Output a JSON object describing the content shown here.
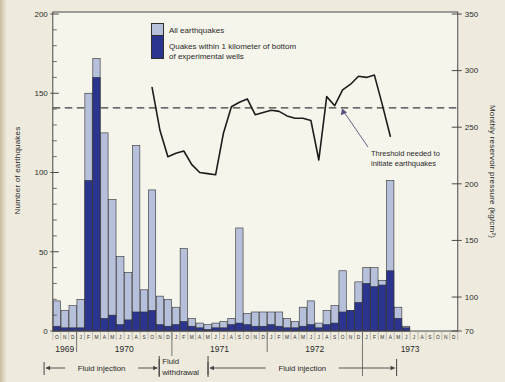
{
  "figure": {
    "legend": {
      "item1": "All earthquakes",
      "item2_line1": "Quakes within 1 kilometer of bottom",
      "item2_line2": "of experimental wells"
    },
    "left_axis_title": "Number of earthquakes",
    "right_axis_title": "Monthly reservoir pressure (kg/cm²)",
    "threshold_label_line1": "Threshold needed to",
    "threshold_label_line2": "initiate earthquakes",
    "colors": {
      "all_quakes": "#b6c0da",
      "near_well_quakes": "#2b3590",
      "pressure_line": "#1c1c1c",
      "axis": "#4a4a4a",
      "threshold_dash": "#3c3c3c",
      "pointer": "#5c4f7d"
    }
  },
  "chart_data": {
    "type": "bar",
    "title": "",
    "xlabel": "",
    "ylabel_left": "Number of earthquakes",
    "ylabel_right": "Monthly reservoir pressure (kg/cm²)",
    "left_axis": {
      "range": [
        0,
        200
      ],
      "ticks": [
        200,
        150,
        100,
        50,
        0
      ],
      "minor_step": 10
    },
    "right_axis": {
      "range": [
        70,
        350
      ],
      "ticks": [
        350,
        300,
        250,
        200,
        150,
        100,
        70
      ]
    },
    "months": [
      "O",
      "N",
      "D",
      "J",
      "F",
      "M",
      "A",
      "M",
      "J",
      "J",
      "A",
      "S",
      "O",
      "N",
      "D",
      "J",
      "F",
      "M",
      "A",
      "M",
      "J",
      "J",
      "A",
      "S",
      "O",
      "N",
      "D",
      "J",
      "F",
      "M",
      "A",
      "M",
      "J",
      "J",
      "A",
      "S",
      "O",
      "N",
      "D",
      "J",
      "F",
      "M",
      "A",
      "M",
      "J",
      "J",
      "A",
      "S",
      "O",
      "N",
      "D"
    ],
    "years": [
      {
        "label": "1969",
        "from_month": 0,
        "to_month": 3
      },
      {
        "label": "1970",
        "from_month": 3,
        "to_month": 15
      },
      {
        "label": "1971",
        "from_month": 15,
        "to_month": 27
      },
      {
        "label": "1972",
        "from_month": 27,
        "to_month": 39
      },
      {
        "label": "1973",
        "from_month": 39,
        "to_month": 51
      }
    ],
    "series": [
      {
        "name": "All earthquakes",
        "values": [
          19,
          13,
          16,
          20,
          150,
          172,
          125,
          83,
          47,
          37,
          117,
          26,
          89,
          22,
          20,
          15,
          52,
          8,
          5,
          4,
          5,
          6,
          8,
          65,
          11,
          12,
          12,
          12,
          12,
          8,
          6,
          15,
          19,
          5,
          13,
          16,
          38,
          13,
          31,
          40,
          40,
          32,
          95,
          15,
          3,
          0,
          0,
          0,
          0,
          0,
          0
        ]
      },
      {
        "name": "Quakes within 1 kilometer of bottom of experimental wells",
        "values": [
          3,
          2,
          2,
          2,
          95,
          160,
          8,
          10,
          4,
          7,
          12,
          12,
          13,
          4,
          3,
          4,
          6,
          3,
          2,
          1,
          2,
          2,
          4,
          5,
          4,
          3,
          3,
          4,
          3,
          2,
          2,
          3,
          4,
          2,
          4,
          5,
          12,
          13,
          18,
          30,
          28,
          29,
          38,
          8,
          2,
          0,
          0,
          0,
          0,
          0,
          0
        ]
      }
    ],
    "pressure_line": {
      "name": "Monthly reservoir pressure (kg/cm²)",
      "start_month_index": 12,
      "values": [
        285,
        247,
        224,
        227,
        229,
        217,
        210,
        209,
        208,
        245,
        268,
        272,
        275,
        261,
        263,
        265,
        264,
        260,
        258,
        258,
        256,
        221,
        277,
        269,
        283,
        288,
        295,
        294,
        296,
        270,
        242
      ]
    },
    "threshold_pressure": 267,
    "phases": [
      {
        "label": "Fluid injection",
        "from_month": -1.1,
        "to_month": 13.4,
        "style": "arrow"
      },
      {
        "label_line1": "Fluid",
        "label_line2": "withdrawal",
        "from_month": 13.4,
        "to_month": 19.55,
        "style": "text"
      },
      {
        "label": "Fluid injection",
        "from_month": 19.55,
        "to_month": 43.3,
        "style": "arrow"
      }
    ],
    "grid": false,
    "legend_position": "top-center"
  }
}
